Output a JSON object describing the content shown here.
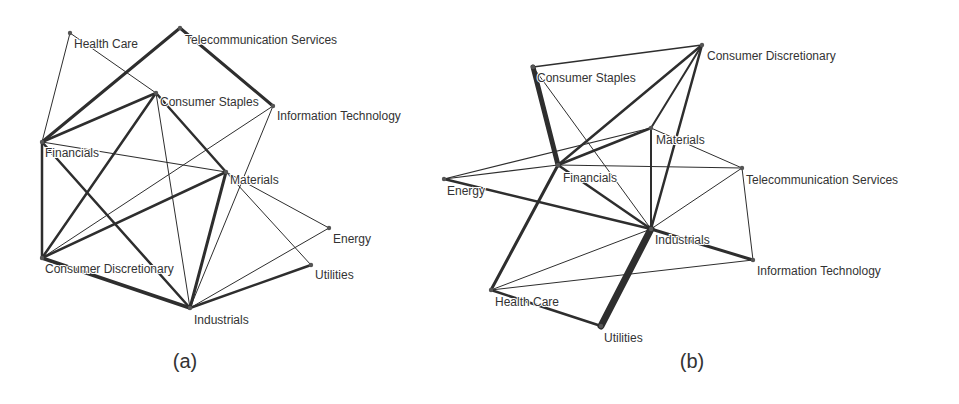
{
  "panels": [
    {
      "id": "a",
      "caption": "(a)",
      "caption_pos": [
        185,
        368
      ],
      "nodes": [
        {
          "name": "Health Care",
          "x": 70,
          "y": 33,
          "lx": 74,
          "ly": 48
        },
        {
          "name": "Telecommunication Services",
          "x": 180,
          "y": 28,
          "lx": 185,
          "ly": 44
        },
        {
          "name": "Consumer Staples",
          "x": 156,
          "y": 93,
          "lx": 160,
          "ly": 106
        },
        {
          "name": "Information Technology",
          "x": 273,
          "y": 106,
          "lx": 277,
          "ly": 120
        },
        {
          "name": "Financials",
          "x": 42,
          "y": 142,
          "lx": 45,
          "ly": 157
        },
        {
          "name": "Materials",
          "x": 226,
          "y": 172,
          "lx": 230,
          "ly": 184
        },
        {
          "name": "Energy",
          "x": 329,
          "y": 228,
          "lx": 333,
          "ly": 243
        },
        {
          "name": "Consumer Discretionary",
          "x": 42,
          "y": 258,
          "lx": 45,
          "ly": 273
        },
        {
          "name": "Utilities",
          "x": 311,
          "y": 265,
          "lx": 315,
          "ly": 279
        },
        {
          "name": "Industrials",
          "x": 190,
          "y": 308,
          "lx": 194,
          "ly": 324
        }
      ],
      "edges": [
        {
          "from": "Health Care",
          "to": "Financials",
          "w": 1
        },
        {
          "from": "Health Care",
          "to": "Consumer Staples",
          "w": 1
        },
        {
          "from": "Telecommunication Services",
          "to": "Financials",
          "w": 3
        },
        {
          "from": "Telecommunication Services",
          "to": "Information Technology",
          "w": 3
        },
        {
          "from": "Consumer Staples",
          "to": "Financials",
          "w": 2.5
        },
        {
          "from": "Consumer Staples",
          "to": "Consumer Discretionary",
          "w": 2.5
        },
        {
          "from": "Consumer Staples",
          "to": "Materials",
          "w": 2.5
        },
        {
          "from": "Consumer Staples",
          "to": "Industrials",
          "w": 1
        },
        {
          "from": "Information Technology",
          "to": "Consumer Discretionary",
          "w": 1
        },
        {
          "from": "Information Technology",
          "to": "Industrials",
          "w": 1
        },
        {
          "from": "Financials",
          "to": "Materials",
          "w": 1.2
        },
        {
          "from": "Financials",
          "to": "Consumer Discretionary",
          "w": 2.5
        },
        {
          "from": "Financials",
          "to": "Industrials",
          "w": 2.5
        },
        {
          "from": "Materials",
          "to": "Consumer Discretionary",
          "w": 2.5
        },
        {
          "from": "Materials",
          "to": "Industrials",
          "w": 3
        },
        {
          "from": "Materials",
          "to": "Energy",
          "w": 1
        },
        {
          "from": "Materials",
          "to": "Utilities",
          "w": 1
        },
        {
          "from": "Energy",
          "to": "Industrials",
          "w": 1
        },
        {
          "from": "Utilities",
          "to": "Industrials",
          "w": 2.5
        },
        {
          "from": "Consumer Discretionary",
          "to": "Industrials",
          "w": 3.5
        }
      ]
    },
    {
      "id": "b",
      "caption": "(b)",
      "caption_pos": [
        692,
        368
      ],
      "nodes": [
        {
          "name": "Consumer Discretionary",
          "x": 702,
          "y": 45,
          "lx": 707,
          "ly": 60
        },
        {
          "name": "Consumer Staples",
          "x": 533,
          "y": 67,
          "lx": 537,
          "ly": 82
        },
        {
          "name": "Materials",
          "x": 651,
          "y": 128,
          "lx": 656,
          "ly": 144
        },
        {
          "name": "Financials",
          "x": 558,
          "y": 165,
          "lx": 563,
          "ly": 182
        },
        {
          "name": "Energy",
          "x": 444,
          "y": 179,
          "lx": 447,
          "ly": 195
        },
        {
          "name": "Telecommunication Services",
          "x": 742,
          "y": 168,
          "lx": 746,
          "ly": 184
        },
        {
          "name": "Industrials",
          "x": 651,
          "y": 229,
          "lx": 655,
          "ly": 244
        },
        {
          "name": "Information Technology",
          "x": 753,
          "y": 260,
          "lx": 757,
          "ly": 275
        },
        {
          "name": "Health Care",
          "x": 491,
          "y": 290,
          "lx": 495,
          "ly": 306
        },
        {
          "name": "Utilities",
          "x": 601,
          "y": 326,
          "lx": 604,
          "ly": 342
        }
      ],
      "edges": [
        {
          "from": "Consumer Staples",
          "to": "Consumer Discretionary",
          "w": 1.5
        },
        {
          "from": "Consumer Staples",
          "to": "Financials",
          "w": 5
        },
        {
          "from": "Consumer Staples",
          "to": "Industrials",
          "w": 1
        },
        {
          "from": "Consumer Discretionary",
          "to": "Financials",
          "w": 2.5
        },
        {
          "from": "Consumer Discretionary",
          "to": "Materials",
          "w": 2
        },
        {
          "from": "Consumer Discretionary",
          "to": "Industrials",
          "w": 2.5
        },
        {
          "from": "Materials",
          "to": "Financials",
          "w": 2.5
        },
        {
          "from": "Materials",
          "to": "Energy",
          "w": 1.2
        },
        {
          "from": "Materials",
          "to": "Industrials",
          "w": 2
        },
        {
          "from": "Materials",
          "to": "Telecommunication Services",
          "w": 1
        },
        {
          "from": "Financials",
          "to": "Energy",
          "w": 1.2
        },
        {
          "from": "Financials",
          "to": "Telecommunication Services",
          "w": 1.2
        },
        {
          "from": "Financials",
          "to": "Industrials",
          "w": 2.5
        },
        {
          "from": "Financials",
          "to": "Health Care",
          "w": 3
        },
        {
          "from": "Energy",
          "to": "Industrials",
          "w": 2.5
        },
        {
          "from": "Telecommunication Services",
          "to": "Industrials",
          "w": 1
        },
        {
          "from": "Telecommunication Services",
          "to": "Information Technology",
          "w": 1
        },
        {
          "from": "Industrials",
          "to": "Information Technology",
          "w": 3
        },
        {
          "from": "Industrials",
          "to": "Health Care",
          "w": 1
        },
        {
          "from": "Industrials",
          "to": "Utilities",
          "w": 7
        },
        {
          "from": "Health Care",
          "to": "Information Technology",
          "w": 1
        },
        {
          "from": "Health Care",
          "to": "Utilities",
          "w": 2.5
        }
      ]
    }
  ]
}
